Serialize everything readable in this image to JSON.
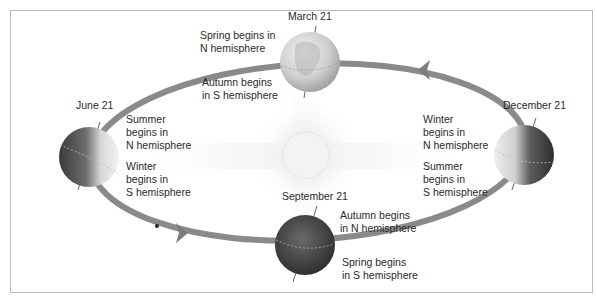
{
  "diagram": {
    "type": "earth-orbit-seasons",
    "colors": {
      "frame": "#b9b9b9",
      "orbit": "#8a8a8a",
      "text": "#2a2a2a",
      "sun": "#f2f2f2"
    },
    "positions": [
      {
        "id": "march",
        "date": "March 21",
        "north_note": [
          "Spring begins in",
          "N hemisphere"
        ],
        "south_note": [
          "Autumn begins",
          "in S hemisphere"
        ]
      },
      {
        "id": "june",
        "date": "June 21",
        "north_note": [
          "Summer",
          "begins in",
          "N hemisphere"
        ],
        "south_note": [
          "Winter",
          "begins in",
          "S hemisphere"
        ]
      },
      {
        "id": "september",
        "date": "September 21",
        "north_note": [
          "Autumn begins",
          "in N hemisphere"
        ],
        "south_note": [
          "Spring begins",
          "in S hemisphere"
        ]
      },
      {
        "id": "december",
        "date": "December 21",
        "north_note": [
          "Winter",
          "begins in",
          "N hemisphere"
        ],
        "south_note": [
          "Summer",
          "begins in",
          "S hemisphere"
        ]
      }
    ],
    "central_body": "sun",
    "orbit_direction_arrows": [
      "arrow-left-top",
      "arrow-right-bottom"
    ]
  }
}
